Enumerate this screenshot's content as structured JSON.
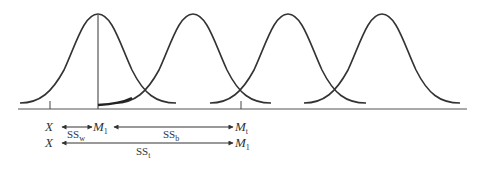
{
  "diagram": {
    "type": "overlapping-normal-distributions",
    "curves": [
      {
        "name": "distribution-1",
        "peak_x": 98
      },
      {
        "name": "distribution-2",
        "peak_x": 193
      },
      {
        "name": "distribution-3",
        "peak_x": 288
      },
      {
        "name": "distribution-4",
        "peak_x": 382
      }
    ],
    "colors": {
      "stroke": "#333333",
      "background": "#ffffff"
    },
    "labels": {
      "row1": {
        "x": {
          "base": "X",
          "sub": ""
        },
        "m1": {
          "base": "M",
          "sub": "1"
        },
        "mt": {
          "base": "M",
          "sub": "t"
        },
        "ssw": {
          "base": "SS",
          "sub": "w"
        },
        "ssb": {
          "base": "SS",
          "sub": "b"
        }
      },
      "row2": {
        "x": {
          "base": "X",
          "sub": ""
        },
        "m1": {
          "base": "M",
          "sub": "1"
        },
        "sst": {
          "base": "SS",
          "sub": "t"
        }
      }
    }
  }
}
